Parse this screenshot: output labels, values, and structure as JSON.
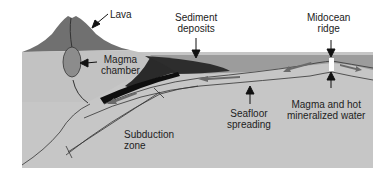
{
  "diagram": {
    "labels": {
      "lava": "Lava",
      "sediment_line1": "Sediment",
      "sediment_line2": "deposits",
      "ridge_line1": "Midocean",
      "ridge_line2": "ridge",
      "magma_chamber_line1": "Magma",
      "magma_chamber_line2": "chamber",
      "seafloor_line1": "Seafloor",
      "seafloor_line2": "spreading",
      "magma_water_line1": "Magma and hot",
      "magma_water_line2": "mineralized water",
      "subduction_line1": "Subduction",
      "subduction_line2": "zone"
    },
    "colors": {
      "crust": "#c4c4c4",
      "ocean": "#9a9a9a",
      "volcano": "#6e6e6e",
      "magma": "#8a8a8a",
      "sediment": "#2e2e2e",
      "slab": "#111111",
      "arrow": "#6a6a6a",
      "line": "#333333"
    }
  }
}
